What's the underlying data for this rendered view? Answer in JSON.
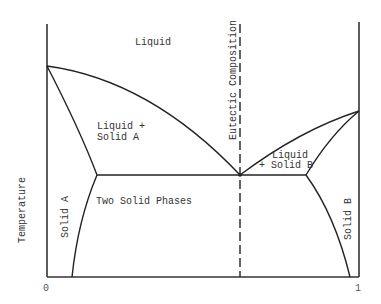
{
  "diagram": {
    "type": "binary eutectic phase diagram",
    "ylabel": "Temperature",
    "x_ticks": [
      "0",
      "1"
    ],
    "regions": {
      "liquid": "Liquid",
      "liquid_solid_a_line1": "Liquid +",
      "liquid_solid_a_line2": "Solid A",
      "liquid_solid_b_line1": "Liquid",
      "liquid_solid_b_line2": "+ Solid B",
      "two_solid": "Two Solid Phases",
      "solid_a": "Solid A",
      "solid_b": "Solid B"
    },
    "annotations": {
      "eutectic": "Eutectic Composition"
    },
    "colors": {
      "line": "#222222",
      "text": "#333333",
      "background": "#ffffff"
    }
  }
}
